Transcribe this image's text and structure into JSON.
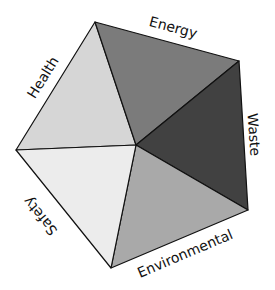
{
  "diagram": {
    "type": "pentagon-segments",
    "segments": [
      {
        "name": "Health",
        "color": "#d6d6d6"
      },
      {
        "name": "Energy",
        "color": "#7b7b7b"
      },
      {
        "name": "Waste",
        "color": "#414141"
      },
      {
        "name": "Environmental",
        "color": "#a9a9a9"
      },
      {
        "name": "Safety",
        "color": "#ececec"
      }
    ]
  }
}
